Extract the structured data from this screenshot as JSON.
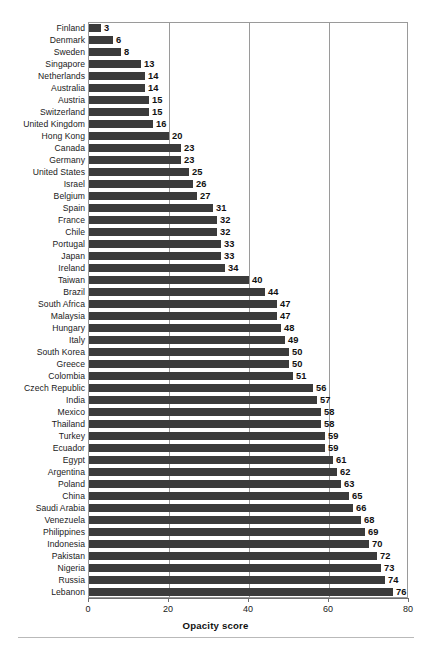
{
  "chart_data": {
    "type": "bar",
    "orientation": "horizontal",
    "title": "",
    "subtitle": "",
    "xlabel": "Opacity score",
    "ylabel": "",
    "xlim": [
      0,
      80
    ],
    "xticks": [
      0,
      20,
      40,
      60,
      80
    ],
    "xtick_labels": [
      "0",
      "20",
      "40",
      "60",
      "80"
    ],
    "grid": "vertical",
    "legend": null,
    "bar_color": "#3b3b3b",
    "value_labels": true,
    "categories": [
      "Finland",
      "Denmark",
      "Sweden",
      "Singapore",
      "Netherlands",
      "Australia",
      "Austria",
      "Switzerland",
      "United Kingdom",
      "Hong Kong",
      "Canada",
      "Germany",
      "United States",
      "Israel",
      "Belgium",
      "Spain",
      "France",
      "Chile",
      "Portugal",
      "Japan",
      "Ireland",
      "Taiwan",
      "Brazil",
      "South Africa",
      "Malaysia",
      "Hungary",
      "Italy",
      "South Korea",
      "Greece",
      "Colombia",
      "Czech Republic",
      "India",
      "Mexico",
      "Thailand",
      "Turkey",
      "Ecuador",
      "Egypt",
      "Argentina",
      "Poland",
      "China",
      "Saudi Arabia",
      "Venezuela",
      "Philippines",
      "Indonesia",
      "Pakistan",
      "Nigeria",
      "Russia",
      "Lebanon"
    ],
    "values": [
      3,
      6,
      8,
      13,
      14,
      14,
      15,
      15,
      16,
      20,
      23,
      23,
      25,
      26,
      27,
      31,
      32,
      32,
      33,
      33,
      34,
      40,
      44,
      47,
      47,
      48,
      49,
      50,
      50,
      51,
      56,
      57,
      58,
      58,
      59,
      59,
      61,
      62,
      63,
      65,
      66,
      68,
      69,
      70,
      72,
      73,
      74,
      76
    ],
    "value_label_texts": [
      "3",
      "6",
      "8",
      "13",
      "14",
      "14",
      "15",
      "15",
      "16",
      "20",
      "23",
      "23",
      "25",
      "26",
      "27",
      "31",
      "32",
      "32",
      "33",
      "33",
      "34",
      "40",
      "44",
      "47",
      "47",
      "48",
      "49",
      "50",
      "50",
      "51",
      "56",
      "57",
      "58",
      "58",
      "59",
      "59",
      "61",
      "62",
      "63",
      "65",
      "66",
      "68",
      "69",
      "70",
      "72",
      "73",
      "74",
      "76"
    ]
  }
}
